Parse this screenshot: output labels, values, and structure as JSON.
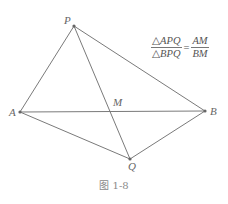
{
  "figure": {
    "caption": "图 1-8",
    "line_color": "#7a7a7a",
    "label_color": "#666666"
  },
  "points": {
    "P": {
      "label": "P",
      "x": 74,
      "y": 26
    },
    "A": {
      "label": "A",
      "x": 20,
      "y": 112
    },
    "B": {
      "label": "B",
      "x": 205,
      "y": 111
    },
    "Q": {
      "label": "Q",
      "x": 130,
      "y": 159
    },
    "M": {
      "label": "M",
      "x": 110,
      "y": 111
    }
  },
  "segments": [
    [
      "P",
      "A"
    ],
    [
      "P",
      "B"
    ],
    [
      "P",
      "Q"
    ],
    [
      "A",
      "B"
    ],
    [
      "A",
      "Q"
    ],
    [
      "B",
      "Q"
    ]
  ],
  "formula": {
    "left_numerator": "△APQ",
    "left_denominator": "△BPQ",
    "equals": "=",
    "right_numerator": "AM",
    "right_denominator": "BM"
  }
}
